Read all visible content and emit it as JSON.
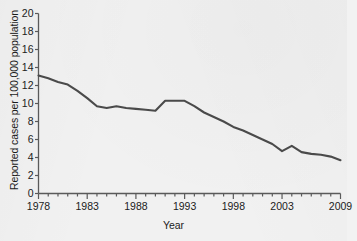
{
  "chart_data": {
    "type": "line",
    "title": "",
    "xlabel": "Year",
    "ylabel": "Reported cases per 100,000 population",
    "xlim": [
      1978,
      2009
    ],
    "ylim": [
      0,
      20
    ],
    "ytick_step": 2,
    "xtick_step": 1,
    "grid": false,
    "legend": false,
    "line_color": "#4a4a4a",
    "axis_color": "#5a5a5a",
    "background_color": "#f1f1f1",
    "ytick_labels": [
      "0",
      "2",
      "4",
      "6",
      "8",
      "10",
      "12",
      "14",
      "16",
      "18",
      "20"
    ],
    "ytick_values": [
      0,
      2,
      4,
      6,
      8,
      10,
      12,
      14,
      16,
      18,
      20
    ],
    "xtick_labels": [
      "1978",
      "1983",
      "1988",
      "1993",
      "1998",
      "2003",
      "2009"
    ],
    "xtick_values": [
      1978,
      1983,
      1988,
      1993,
      1998,
      2003,
      2009
    ],
    "x": [
      1978,
      1979,
      1980,
      1981,
      1982,
      1983,
      1984,
      1985,
      1986,
      1987,
      1988,
      1989,
      1990,
      1991,
      1992,
      1993,
      1994,
      1995,
      1996,
      1997,
      1998,
      1999,
      2000,
      2001,
      2002,
      2003,
      2004,
      2005,
      2006,
      2007,
      2008,
      2009
    ],
    "values": [
      13.1,
      12.8,
      12.4,
      12.1,
      11.4,
      10.6,
      9.7,
      9.5,
      9.7,
      9.5,
      9.4,
      9.3,
      9.2,
      10.3,
      10.3,
      10.3,
      9.7,
      9.0,
      8.5,
      8.0,
      7.4,
      7.0,
      6.5,
      6.0,
      5.5,
      4.7,
      5.3,
      4.6,
      4.4,
      4.3,
      4.1,
      3.7
    ],
    "series_name": "Reported cases per 100,000 population"
  }
}
